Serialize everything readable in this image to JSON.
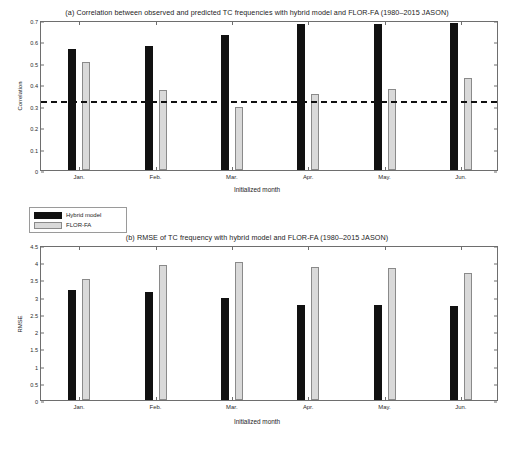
{
  "figure": {
    "legend": {
      "series": [
        {
          "key": "hybrid",
          "label": "Hybrid model",
          "color": "#111111"
        },
        {
          "key": "flor",
          "label": "FLOR-FA",
          "color": "#d9d9d9"
        }
      ]
    }
  },
  "chart_data": [
    {
      "type": "bar",
      "panel": "a",
      "title": "(a) Correlation between observed and predicted TC frequencies with hybrid model and FLOR-FA (1980–2015 JASON)",
      "xlabel": "Initialized month",
      "ylabel": "Correlation",
      "categories": [
        "Jan.",
        "Feb.",
        "Mar.",
        "Apr.",
        "May.",
        "Jun."
      ],
      "ylim": [
        0,
        0.7
      ],
      "yticks": [
        0,
        0.1,
        0.2,
        0.3,
        0.4,
        0.5,
        0.6,
        0.7
      ],
      "ytick_labels": [
        "0",
        "0.1",
        "0.2",
        "0.3",
        "0.4",
        "0.5",
        "0.6",
        "0.7"
      ],
      "grid": false,
      "legend_position": "below-left",
      "annotations": [
        {
          "type": "hline",
          "value": 0.325,
          "style": "dashed",
          "color": "#111111",
          "note": "95% significance threshold"
        }
      ],
      "series": [
        {
          "name": "Hybrid model",
          "color": "#111111",
          "values": [
            0.565,
            0.578,
            0.632,
            0.682,
            0.681,
            0.688
          ]
        },
        {
          "name": "FLOR-FA",
          "color": "#d9d9d9",
          "values": [
            0.505,
            0.372,
            0.292,
            0.353,
            0.379,
            0.428
          ]
        }
      ]
    },
    {
      "type": "bar",
      "panel": "b",
      "title": "(b) RMSE of TC frequency with hybrid model and FLOR-FA (1980–2015 JASON)",
      "xlabel": "Initialized month",
      "ylabel": "RMSE",
      "categories": [
        "Jan.",
        "Feb.",
        "Mar.",
        "Apr.",
        "May.",
        "Jun."
      ],
      "ylim": [
        0,
        4.5
      ],
      "yticks": [
        0,
        0.5,
        1,
        1.5,
        2,
        2.5,
        3,
        3.5,
        4,
        4.5
      ],
      "ytick_labels": [
        "0",
        "0.5",
        "1",
        "1.5",
        "2",
        "2.5",
        "3",
        "3.5",
        "4",
        "4.5"
      ],
      "grid": false,
      "legend_position": "none",
      "annotations": [],
      "series": [
        {
          "name": "Hybrid model",
          "color": "#111111",
          "values": [
            3.2,
            3.13,
            2.97,
            2.77,
            2.77,
            2.72
          ]
        },
        {
          "name": "FLOR-FA",
          "color": "#d9d9d9",
          "values": [
            3.5,
            3.92,
            4.01,
            3.85,
            3.82,
            3.68
          ]
        }
      ]
    }
  ]
}
